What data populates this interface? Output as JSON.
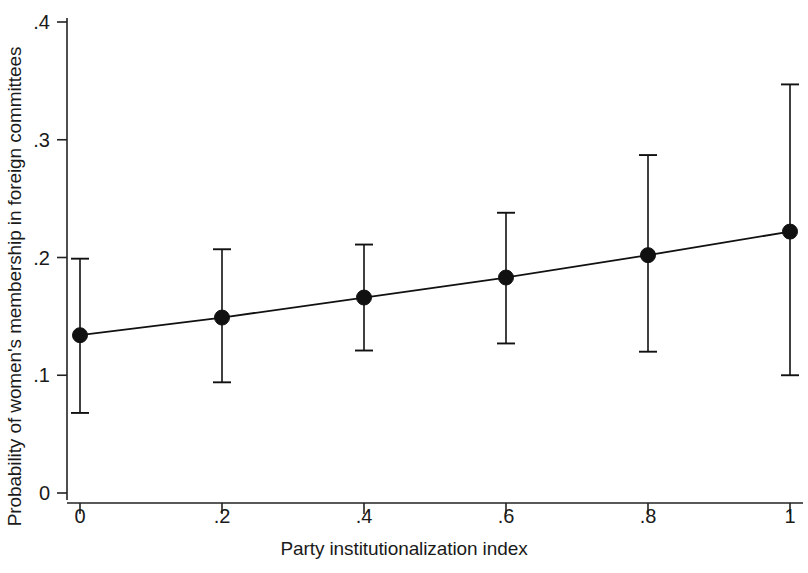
{
  "chart_data": {
    "type": "line",
    "title": "",
    "subtitle": "",
    "xlabel": "Party institutionalization index",
    "ylabel": "Probability of women's membership in foreign committees",
    "x": [
      0,
      0.2,
      0.4,
      0.6,
      0.8,
      1
    ],
    "xtick_labels": [
      "0",
      ".2",
      ".4",
      ".6",
      ".8",
      "1"
    ],
    "ytick_labels": [
      "0",
      ".1",
      ".2",
      ".3",
      ".4"
    ],
    "ytick_values": [
      0,
      0.1,
      0.2,
      0.3,
      0.4
    ],
    "xlim": [
      0,
      1
    ],
    "ylim": [
      0,
      0.4
    ],
    "grid": false,
    "legend": null,
    "series": [
      {
        "name": "Predicted probability",
        "values": [
          0.134,
          0.149,
          0.166,
          0.183,
          0.202,
          0.222
        ],
        "ci_lower": [
          0.068,
          0.094,
          0.121,
          0.127,
          0.12,
          0.1
        ],
        "ci_upper": [
          0.199,
          0.207,
          0.211,
          0.238,
          0.287,
          0.347
        ],
        "marker": "filled-circle",
        "color": "#111111"
      }
    ],
    "annotations": []
  },
  "figure": {
    "x_axis_title": "Party institutionalization index",
    "y_axis_title": "Probability of women's membership in foreign committees",
    "axis_color": "#222222",
    "marker_color": "#111111",
    "line_color": "#111111"
  }
}
